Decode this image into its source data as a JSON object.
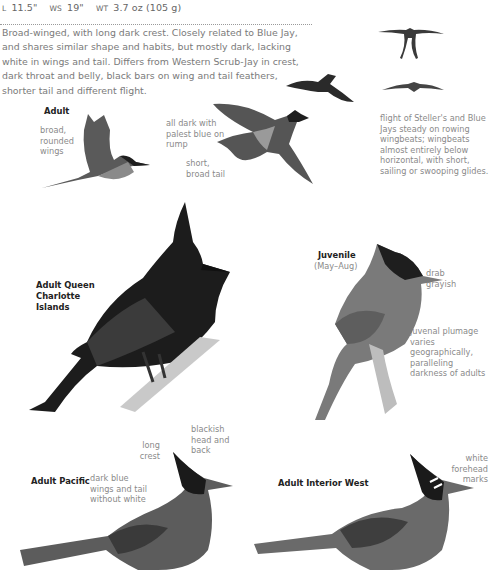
{
  "measurements": {
    "length_label": "L",
    "length": "11.5\"",
    "wingspan_label": "WS",
    "wingspan": "19\"",
    "weight_label": "WT",
    "weight": "3.7 oz (105 g)"
  },
  "description": "Broad-winged, with long dark crest. Closely related to Blue Jay, and shares similar shape and habits, but mostly dark, lacking white in wings and tail. Differs from Western Scrub-Jay in crest, dark throat and belly, black bars on wing and tail feathers, shorter tail and different flight.",
  "flight_section": {
    "adult_title": "Adult",
    "wings_note": "broad, rounded wings",
    "rump_note": "all dark with palest blue on rump",
    "tail_note": "short, broad tail",
    "flight_note": "flight of Steller's and Blue Jays steady on rowing wingbeats; wingbeats almost entirely below horizontal, with short, sailing or swooping glides."
  },
  "plates": {
    "queen_charlotte": {
      "title": "Adult Queen Charlotte Islands"
    },
    "juvenile": {
      "title": "Juvenile",
      "season": "(May–Aug)",
      "note_color": "drab grayish",
      "note_variation": "juvenal plumage varies geographically, paralleling darkness of adults"
    },
    "pacific": {
      "title": "Adult Pacific",
      "note_crest": "long crest",
      "note_head": "blackish head and back",
      "note_wings": "dark blue wings and tail without white"
    },
    "interior_west": {
      "title": "Adult Interior West",
      "note_forehead": "white forehead marks"
    }
  }
}
